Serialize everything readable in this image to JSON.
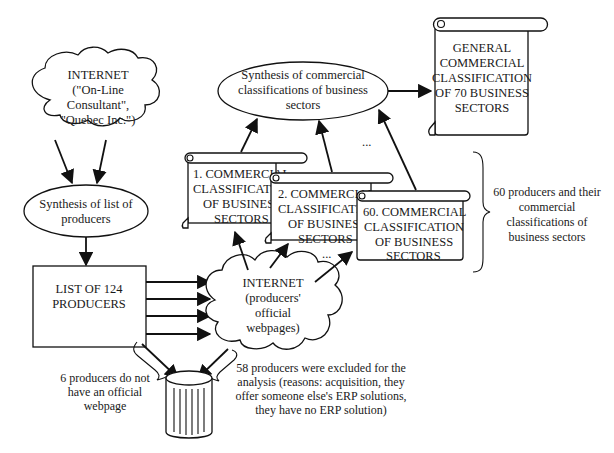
{
  "diagram": {
    "internet_sources": {
      "lines": [
        "INTERNET",
        "(\"On-Line",
        "Consultant\",",
        "\"Quebec Inc.\")"
      ]
    },
    "synthesis_producers": {
      "lines": [
        "Synthesis of list of",
        "producers"
      ]
    },
    "list_producers": {
      "lines": [
        "LIST OF 124",
        "PRODUCERS"
      ]
    },
    "internet_webpages": {
      "lines": [
        "INTERNET",
        "(producers'",
        "official",
        "webpages)"
      ]
    },
    "scroll_1": {
      "lines": [
        "1. COMMERCIAL",
        "CLASSIFICATION",
        "OF BUSINESS",
        "SECTORS"
      ]
    },
    "scroll_2": {
      "lines": [
        "2. COMMERCIAL",
        "CLASSIFICATION",
        "OF BUSINESS",
        "SECTORS"
      ]
    },
    "scroll_60": {
      "lines": [
        "60. COMMERCIAL",
        "CLASSIFICATION",
        "OF BUSINESS",
        "SECTORS"
      ]
    },
    "synthesis_classifications": {
      "lines": [
        "Synthesis of commercial",
        "classifications of business",
        "sectors"
      ]
    },
    "general_classification": {
      "lines": [
        "GENERAL",
        "COMMERCIAL",
        "CLASSIFICATION",
        "OF 70 BUSINESS",
        "SECTORS"
      ]
    },
    "brace_note": {
      "lines": [
        "60 producers and their",
        "commercial",
        "classifications of",
        "business sectors"
      ]
    },
    "no_webpage_note": {
      "lines": [
        "6 producers do not",
        "have an official",
        "webpage"
      ]
    },
    "excluded_note": {
      "lines": [
        "58 producers were excluded for the",
        "analysis (reasons: acquisition, they",
        "offer someone else's ERP solutions,",
        "they have no ERP solution)"
      ]
    },
    "ellipsis": "..."
  }
}
